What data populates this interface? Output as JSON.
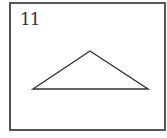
{
  "figure": {
    "label": "11",
    "shape": "triangle",
    "vertices": {
      "apex": [
        90,
        51
      ],
      "left": [
        33,
        89
      ],
      "right": [
        148,
        89
      ]
    },
    "stroke_color": "#333333",
    "frame_color": "#555555"
  }
}
